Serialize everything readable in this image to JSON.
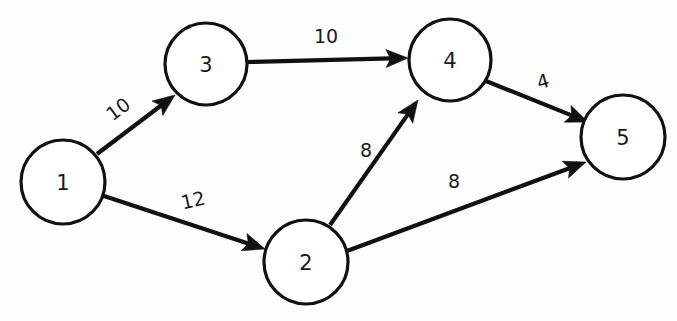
{
  "diagram": {
    "type": "directed-graph",
    "background_color": "#fdfdfd",
    "stroke_color": "#111111",
    "node_fill_color": "#ffffff",
    "nodes": [
      {
        "id": "1",
        "label": "1",
        "cx": 63,
        "cy": 182,
        "r": 42
      },
      {
        "id": "2",
        "label": "2",
        "cx": 306,
        "cy": 262,
        "r": 42
      },
      {
        "id": "3",
        "label": "3",
        "cx": 206,
        "cy": 64,
        "r": 41
      },
      {
        "id": "4",
        "label": "4",
        "cx": 450,
        "cy": 60,
        "r": 41
      },
      {
        "id": "5",
        "label": "5",
        "cx": 623,
        "cy": 137,
        "r": 42
      }
    ],
    "edges": [
      {
        "id": "1-3",
        "from": "1",
        "to": "3",
        "weight": "10",
        "x1": 97,
        "y1": 154,
        "x2": 175,
        "y2": 95,
        "label_x": 118,
        "label_y": 109,
        "label_rotate": -37
      },
      {
        "id": "3-4",
        "from": "3",
        "to": "4",
        "weight": "10",
        "x1": 247,
        "y1": 62,
        "x2": 408,
        "y2": 58,
        "label_x": 326,
        "label_y": 36,
        "label_rotate": 0
      },
      {
        "id": "1-2",
        "from": "1",
        "to": "2",
        "weight": "12",
        "x1": 101,
        "y1": 195,
        "x2": 265,
        "y2": 249,
        "label_x": 193,
        "label_y": 200,
        "label_rotate": -13
      },
      {
        "id": "2-4",
        "from": "2",
        "to": "4",
        "weight": "8",
        "x1": 330,
        "y1": 225,
        "x2": 418,
        "y2": 100,
        "label_x": 366,
        "label_y": 150,
        "label_rotate": 0
      },
      {
        "id": "2-5",
        "from": "2",
        "to": "5",
        "weight": "8",
        "x1": 347,
        "y1": 251,
        "x2": 586,
        "y2": 162,
        "label_x": 454,
        "label_y": 181,
        "label_rotate": 0
      },
      {
        "id": "4-5",
        "from": "4",
        "to": "5",
        "weight": "4",
        "x1": 486,
        "y1": 81,
        "x2": 588,
        "y2": 122,
        "label_x": 543,
        "label_y": 81,
        "label_rotate": -16
      }
    ]
  }
}
